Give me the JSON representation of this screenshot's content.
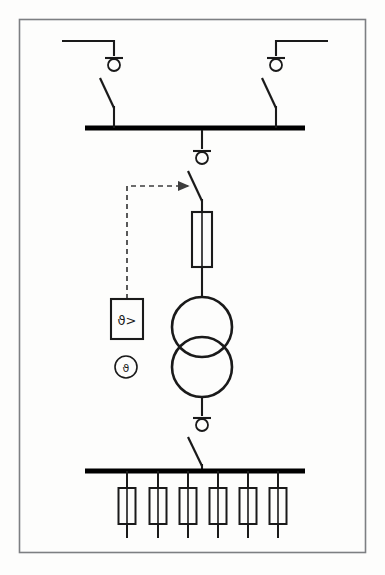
{
  "diagram": {
    "type": "electrical-single-line-diagram",
    "title": "",
    "canvas": {
      "width": 385,
      "height": 575,
      "background": "#fdfdfc"
    },
    "frame": {
      "name": "drawing-border",
      "x": 19,
      "y": 19,
      "width": 347,
      "height": 534,
      "stroke": "#7d7f82",
      "stroke_width": 1.6
    },
    "colors": {
      "line": "#1a1a1a",
      "busbar": "#000000",
      "frame": "#7d7f82",
      "dashed_control": "#4d4d4d",
      "background": "#fdfdfc"
    },
    "busbars": [
      {
        "name": "upper-busbar",
        "label": "",
        "x1": 85,
        "x2": 305,
        "y": 128,
        "thickness": 5
      },
      {
        "name": "lower-busbar",
        "label": "",
        "x1": 85,
        "x2": 305,
        "y": 471,
        "thickness": 5
      }
    ],
    "incoming_feeders": [
      {
        "name": "incoming-feeder-left",
        "side": "left",
        "line_start_x": 62,
        "line_y": 41,
        "drop_x": 114,
        "marker_y": 63,
        "switch_top_y": 76,
        "switch_bottom_y": 128,
        "blade_offset": -14
      },
      {
        "name": "incoming-feeder-right",
        "side": "right",
        "line_start_x": 328,
        "line_y": 41,
        "drop_x": 276,
        "marker_y": 63,
        "switch_top_y": 76,
        "switch_bottom_y": 128,
        "blade_offset": 14
      }
    ],
    "transformer_branch": {
      "name": "transformer-feeder",
      "center_x": 202,
      "hv_breaker": {
        "name": "hv-circuit-breaker",
        "marker_y": 155,
        "switch_top_y": 170,
        "switch_bottom_y": 210,
        "blade_offset": -15
      },
      "hv_fuse": {
        "name": "hv-fuse",
        "x": 192,
        "y": 212,
        "width": 20,
        "height": 55
      },
      "transformer": {
        "name": "power-transformer",
        "upper_circle": {
          "cx": 202,
          "cy": 327,
          "r": 30
        },
        "lower_circle": {
          "cx": 202,
          "cy": 367,
          "r": 30
        },
        "windings": 2
      },
      "lv_breaker": {
        "name": "lv-circuit-breaker",
        "marker_y": 422,
        "switch_top_y": 434,
        "switch_bottom_y": 471,
        "blade_offset": -14
      }
    },
    "protection": {
      "relay": {
        "name": "thermal-overload-relay",
        "label": "ϑ>",
        "description": "temperature-exceeded relay",
        "x": 111,
        "y": 299,
        "width": 32,
        "height": 40
      },
      "sensor": {
        "name": "temperature-sensor",
        "label": "ϑ",
        "description": "temperature sensor",
        "cx": 126,
        "cy": 367,
        "r": 11
      },
      "trip_link": {
        "name": "trip-control-dashed-link",
        "from_x": 127,
        "from_y": 299,
        "corner_y": 186,
        "to_x": 190,
        "style": "dashed",
        "arrow": "right"
      }
    },
    "outgoing_feeders": {
      "name": "outgoing-feeder-group",
      "count": 6,
      "bus_y": 471,
      "fuse_top_y": 488,
      "fuse_height": 36,
      "fuse_width": 17,
      "tail_bottom_y": 538,
      "x_positions": [
        127,
        158,
        188,
        218,
        248,
        278
      ]
    }
  }
}
